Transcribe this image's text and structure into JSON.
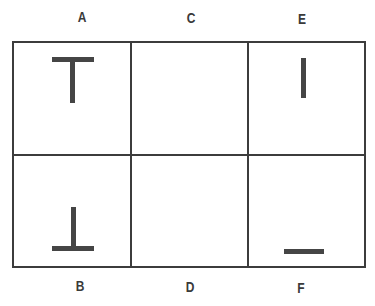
{
  "labels": {
    "top": [
      "A",
      "C",
      "E"
    ],
    "bottom": [
      "B",
      "D",
      "F"
    ]
  },
  "cells": [
    {
      "id": "A",
      "symbol": "T-shape (upright)"
    },
    {
      "id": "C",
      "symbol": "empty"
    },
    {
      "id": "E",
      "symbol": "vertical bar"
    },
    {
      "id": "B",
      "symbol": "inverted T-shape"
    },
    {
      "id": "D",
      "symbol": "empty"
    },
    {
      "id": "F",
      "symbol": "horizontal bar"
    }
  ],
  "colors": {
    "line": "#3c3c3c",
    "symbol": "#454545"
  }
}
